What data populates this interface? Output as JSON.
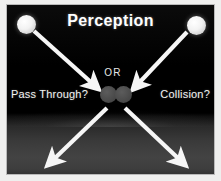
{
  "figure": {
    "title": "Perception",
    "background_color": "#000000",
    "accent_color": "#ffffff",
    "disc_color": "#4d4d4d"
  },
  "center": {
    "or_label": "OR"
  },
  "labels": {
    "left": "Pass Through?",
    "right": "Collision?"
  },
  "objects": [
    {
      "name": "ball-left",
      "role": "incoming-object-left"
    },
    {
      "name": "ball-right",
      "role": "incoming-object-right"
    },
    {
      "name": "disc-left",
      "role": "meeting-point-disc"
    },
    {
      "name": "disc-right",
      "role": "meeting-point-disc"
    }
  ],
  "arrows": [
    {
      "name": "arrow-in-from-top-left",
      "direction": "down-right",
      "x1": 27,
      "y1": 26,
      "x2": 88,
      "y2": 81
    },
    {
      "name": "arrow-in-from-top-right",
      "direction": "down-left",
      "x1": 180,
      "y1": 27,
      "x2": 129,
      "y2": 81
    },
    {
      "name": "arrow-out-to-bottom-left",
      "direction": "down-left",
      "x1": 100,
      "y1": 103,
      "x2": 43,
      "y2": 158
    },
    {
      "name": "arrow-out-to-bottom-right",
      "direction": "down-right",
      "x1": 118,
      "y1": 103,
      "x2": 176,
      "y2": 158
    }
  ]
}
